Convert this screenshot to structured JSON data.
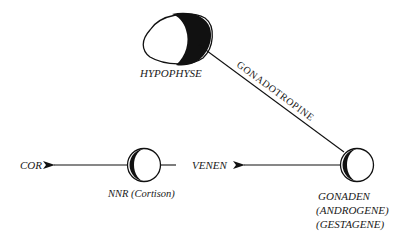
{
  "diagram": {
    "type": "hormone-flow",
    "nodes": {
      "hypophyse": {
        "label": "HYPOPHYSE"
      },
      "gonaden": {
        "label_lines": [
          "GONADEN",
          "(ANDROGENE)",
          "(GESTAGENE)"
        ]
      },
      "nnr": {
        "label": "NNR (Cortison)"
      }
    },
    "edges": {
      "hypophyse_to_gonaden": {
        "label": "GONADOTROPINE"
      },
      "gonaden_to_venen": {
        "target_label": "VENEN"
      },
      "nnr_to_cor": {
        "target_label": "COR"
      }
    },
    "colors": {
      "ink": "#111111",
      "background": "#ffffff"
    }
  }
}
